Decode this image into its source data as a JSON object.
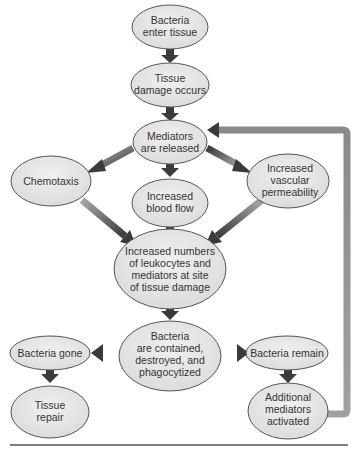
{
  "diagram": {
    "type": "flowchart",
    "colors": {
      "node_fill": "#e6e6e6",
      "node_stroke": "#555555",
      "arrow_dark": "#3a3a3a",
      "arrow_light": "#9a9a9a",
      "text": "#333333",
      "rule": "#555555"
    },
    "nodes": [
      {
        "id": "n1",
        "lines": [
          "Bacteria",
          "enter tissue"
        ]
      },
      {
        "id": "n2",
        "lines": [
          "Tissue",
          "damage occurs"
        ]
      },
      {
        "id": "n3",
        "lines": [
          "Mediators",
          "are released"
        ]
      },
      {
        "id": "n4",
        "lines": [
          "Chemotaxis"
        ]
      },
      {
        "id": "n5",
        "lines": [
          "Increased",
          "blood flow"
        ]
      },
      {
        "id": "n6",
        "lines": [
          "Increased",
          "vascular",
          "permeability"
        ]
      },
      {
        "id": "n7",
        "lines": [
          "Increased numbers",
          "of leukocytes and",
          "mediators at site",
          "of tissue damage"
        ]
      },
      {
        "id": "n8",
        "lines": [
          "Bacteria",
          "are contained,",
          "destroyed, and",
          "phagocytized"
        ]
      },
      {
        "id": "n9",
        "lines": [
          "Bacteria gone"
        ]
      },
      {
        "id": "n10",
        "lines": [
          "Bacteria remain"
        ]
      },
      {
        "id": "n11",
        "lines": [
          "Tissue",
          "repair"
        ]
      },
      {
        "id": "n12",
        "lines": [
          "Additional",
          "mediators",
          "activated"
        ]
      }
    ],
    "edges": [
      {
        "from": "n1",
        "to": "n2"
      },
      {
        "from": "n2",
        "to": "n3"
      },
      {
        "from": "n3",
        "to": "n4"
      },
      {
        "from": "n3",
        "to": "n5"
      },
      {
        "from": "n3",
        "to": "n6"
      },
      {
        "from": "n4",
        "to": "n7"
      },
      {
        "from": "n5",
        "to": "n7"
      },
      {
        "from": "n6",
        "to": "n7"
      },
      {
        "from": "n7",
        "to": "n8"
      },
      {
        "from": "n8",
        "to": "n9"
      },
      {
        "from": "n8",
        "to": "n10"
      },
      {
        "from": "n9",
        "to": "n11"
      },
      {
        "from": "n10",
        "to": "n12"
      },
      {
        "from": "n12",
        "to": "n3",
        "style": "feedback-loop"
      }
    ]
  }
}
